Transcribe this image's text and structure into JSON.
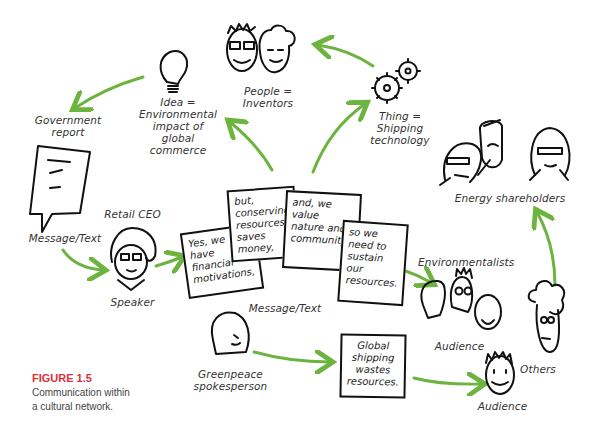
{
  "figure": {
    "label": "FIGURE 1.5",
    "caption_line1": "Communication within",
    "caption_line2": "a cultural network.",
    "accent_color": "#d9323b",
    "arrow_color": "#6db33f",
    "ink_color": "#111111"
  },
  "nodes": {
    "idea": {
      "line1": "Idea =",
      "line2": "Environmental",
      "line3": "impact of",
      "line4": "global",
      "line5": "commerce",
      "icon": "lightbulb-icon"
    },
    "people": {
      "line1": "People =",
      "line2": "Inventors",
      "icon": "inventors-faces-icon"
    },
    "thing": {
      "line1": "Thing =",
      "line2": "Shipping",
      "line3": "technology",
      "icon": "gears-icon"
    },
    "government": {
      "line1": "Government",
      "line2": "report",
      "icon": "document-icon"
    },
    "doc_label": "Message/Text",
    "retail_ceo": "Retail CEO",
    "speaker": "Speaker",
    "energy": "Energy shareholders",
    "environmentalists": "Environmentalists",
    "audience1": "Audience",
    "audience2": "Audience",
    "others": "Others",
    "greenpeace": {
      "line1": "Greenpeace",
      "line2": "spokesperson"
    },
    "message_label": "Message/Text"
  },
  "cards": [
    {
      "l1": "Yes, we",
      "l2": "have",
      "l3": "financial",
      "l4": "motivations,"
    },
    {
      "l1": "but,",
      "l2": "conserving",
      "l3": "resources",
      "l4": "saves",
      "l5": "money,"
    },
    {
      "l1": "and, we",
      "l2": "value",
      "l3": "nature and",
      "l4": "community,",
      "l5": ""
    },
    {
      "l1": "so we",
      "l2": "need to",
      "l3": "sustain",
      "l4": "our",
      "l5": "resources."
    }
  ],
  "global_box": {
    "l1": "Global",
    "l2": "shipping",
    "l3": "wastes",
    "l4": "resources."
  }
}
